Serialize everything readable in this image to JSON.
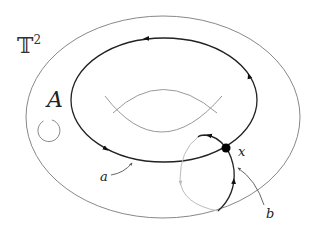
{
  "diagram": {
    "title_label": "𝕋",
    "title_superscript": "2",
    "region_label": "A",
    "loop_a_label": "a",
    "loop_b_label": "b",
    "point_label": "x",
    "colors": {
      "outer_boundary": "#888888",
      "loop_a": "#222222",
      "loop_b_front": "#222222",
      "loop_b_back": "#bbbbbb",
      "hole": "#999999",
      "point": "#000000",
      "background": "#ffffff"
    }
  }
}
